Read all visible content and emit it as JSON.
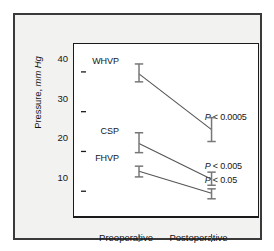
{
  "chart_data": {
    "type": "line",
    "title": "",
    "subtitle": "",
    "xlabel": "",
    "ylabel": "Pressure, mm Hg",
    "ylabel_plain": "Pressure,",
    "ylabel_italic": "mm Hg",
    "categories": [
      "Preoperative",
      "Postoperative"
    ],
    "x": [
      0,
      1
    ],
    "ylim": [
      0,
      44
    ],
    "yticks": [
      10,
      20,
      30,
      40
    ],
    "ytick_labels": [
      "10",
      "20",
      "30",
      "40"
    ],
    "grid": false,
    "legend": "none",
    "error_bars": "vertical with caps",
    "series": [
      {
        "name": "WHVP",
        "label": "WHVP",
        "values": [
          39.5,
          25.5
        ],
        "err_low": [
          2.0,
          3.0
        ],
        "err_high": [
          2.5,
          3.0
        ],
        "annotation": "P < 0.0005"
      },
      {
        "name": "CSP",
        "label": "CSP",
        "values": [
          22.0,
          13.0
        ],
        "err_low": [
          2.3,
          1.5
        ],
        "err_high": [
          2.7,
          1.8
        ],
        "annotation": "P < 0.005"
      },
      {
        "name": "FHVP",
        "label": "FHVP",
        "values": [
          15.0,
          9.5
        ],
        "err_low": [
          1.4,
          1.4
        ],
        "err_high": [
          1.3,
          1.1
        ],
        "annotation": "P < 0.05"
      }
    ],
    "annotations": [
      {
        "text": "P < 0.0005",
        "p_symbol": "P",
        "operator": "<",
        "value": "0.0005",
        "series": "WHVP",
        "at_category": "Postoperative"
      },
      {
        "text": "P < 0.005",
        "p_symbol": "P",
        "operator": "<",
        "value": "0.005",
        "series": "CSP",
        "at_category": "Postoperative"
      },
      {
        "text": "P < 0.05",
        "p_symbol": "P",
        "operator": "<",
        "value": "0.05",
        "series": "FHVP",
        "at_category": "Postoperative"
      }
    ],
    "colors": {
      "line": "#555555",
      "error_bar": "#777777",
      "axis": "#1a1a1a",
      "text": "#161616",
      "plot_background": "#ffffff",
      "figure_background": "#f2f2f1",
      "figure_border": "#3a3a3a"
    }
  }
}
